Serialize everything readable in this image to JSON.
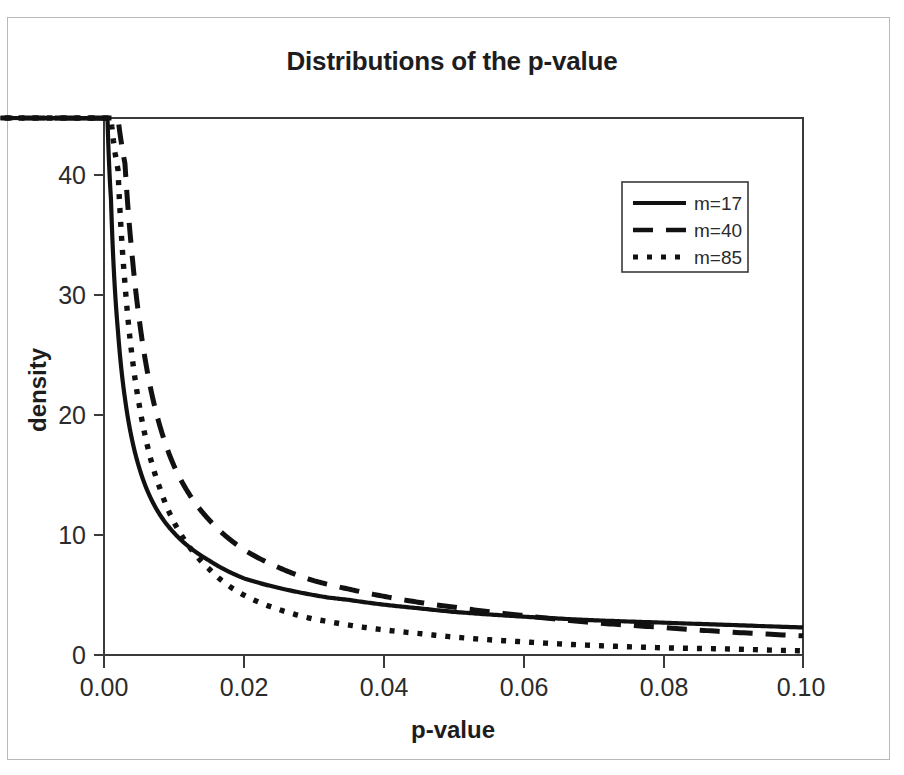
{
  "figure": {
    "title": "Distributions of the p-value",
    "background_color": "#ffffff",
    "line_color": "#111111",
    "axis_color": "#3a3a3a",
    "border_color": "#b9b9b9"
  },
  "axes": {
    "x_title": "p-value",
    "y_title": "density",
    "x_ticks": [
      "0.00",
      "0.02",
      "0.04",
      "0.06",
      "0.08",
      "0.10"
    ],
    "y_ticks": [
      "0",
      "10",
      "20",
      "30",
      "40"
    ]
  },
  "legend": {
    "entries": [
      {
        "label": "m=17",
        "style": "solid"
      },
      {
        "label": "m=40",
        "style": "dashed"
      },
      {
        "label": "m=85",
        "style": "dotted"
      }
    ]
  },
  "chart_data": {
    "type": "line",
    "title": "Distributions of the p-value",
    "xlabel": "p-value",
    "ylabel": "density",
    "xlim": [
      0.0,
      0.1
    ],
    "ylim": [
      0.0,
      44.8
    ],
    "grid": false,
    "legend_position": "upper-right",
    "x": [
      0.0005,
      0.001,
      0.002,
      0.003,
      0.004,
      0.005,
      0.006,
      0.008,
      0.01,
      0.012,
      0.015,
      0.02,
      0.025,
      0.03,
      0.032,
      0.035,
      0.04,
      0.045,
      0.05,
      0.06,
      0.07,
      0.08,
      0.09,
      0.1
    ],
    "series": [
      {
        "name": "m=17",
        "style": "solid",
        "values": [
          44.8,
          38.0,
          27.0,
          21.4,
          18.0,
          15.7,
          14.0,
          11.7,
          10.2,
          9.1,
          7.9,
          6.4,
          5.6,
          5.0,
          4.8,
          4.6,
          4.2,
          3.9,
          3.6,
          3.2,
          2.9,
          2.7,
          2.5,
          2.3
        ]
      },
      {
        "name": "m=40",
        "style": "dashed",
        "values": [
          44.8,
          44.8,
          44.8,
          41.0,
          33.5,
          28.2,
          24.3,
          19.1,
          15.8,
          13.6,
          11.3,
          8.8,
          7.3,
          6.2,
          5.9,
          5.5,
          4.9,
          4.4,
          4.0,
          3.3,
          2.7,
          2.3,
          1.9,
          1.6
        ]
      },
      {
        "name": "m=85",
        "style": "dotted",
        "values": [
          44.8,
          44.8,
          40.5,
          31.0,
          25.0,
          21.0,
          18.0,
          13.9,
          11.1,
          9.2,
          7.2,
          5.0,
          3.8,
          3.0,
          2.8,
          2.5,
          2.1,
          1.8,
          1.5,
          1.1,
          0.8,
          0.6,
          0.5,
          0.35
        ]
      }
    ]
  },
  "geometry": {
    "plot_left": 104,
    "plot_right": 803,
    "plot_top": 118,
    "plot_bottom": 655,
    "y_unit_px_per_10": 120,
    "legend_box": {
      "x": 622,
      "y": 182,
      "w": 126,
      "h": 90
    }
  }
}
